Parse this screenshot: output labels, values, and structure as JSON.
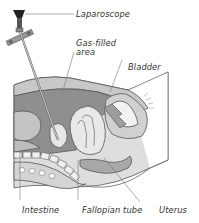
{
  "figure": {
    "labels": {
      "laparoscope": "Laparoscope",
      "gas_filled_line1": "Gas-filled",
      "gas_filled_line2": "area",
      "bladder": "Bladder",
      "intestine": "Intestine",
      "fallopian_tube": "Fallopian tube",
      "uterus": "Uterus"
    }
  },
  "colors": {
    "background": "#ffffff",
    "outline": "#555555",
    "dark_fill": "#8c8c8c",
    "mid_fill": "#b4b4b4",
    "light_fill": "#d9d9d9",
    "very_light_fill": "#ececec",
    "label_text": "#333333"
  }
}
